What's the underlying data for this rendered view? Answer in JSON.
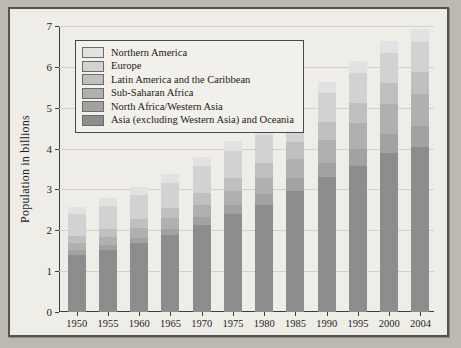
{
  "chart_data": {
    "type": "bar",
    "subtype": "stacked-bar",
    "title": "",
    "xlabel": "",
    "ylabel": "Population in billions",
    "ylim": [
      0,
      7
    ],
    "yticks": [
      0,
      1,
      2,
      3,
      4,
      5,
      6,
      7
    ],
    "grid": true,
    "legend_position": "top-left-inside",
    "categories": [
      "1950",
      "1955",
      "1960",
      "1965",
      "1970",
      "1975",
      "1980",
      "1985",
      "1990",
      "1995",
      "2000",
      "2004"
    ],
    "series": [
      {
        "name": "Asia (excluding Western Asia) and Oceania",
        "color": "#8d8d8d",
        "values": [
          1.4,
          1.52,
          1.68,
          1.88,
          2.13,
          2.39,
          2.63,
          2.97,
          3.3,
          3.58,
          3.88,
          4.05
        ]
      },
      {
        "name": "North Africa/Western Asia",
        "color": "#a2a2a2",
        "values": [
          0.11,
          0.12,
          0.14,
          0.16,
          0.19,
          0.22,
          0.26,
          0.3,
          0.35,
          0.41,
          0.47,
          0.5
        ]
      },
      {
        "name": "Sub-Saharan Africa",
        "color": "#b0b0b0",
        "values": [
          0.18,
          0.2,
          0.23,
          0.26,
          0.3,
          0.34,
          0.4,
          0.47,
          0.55,
          0.64,
          0.73,
          0.78
        ]
      },
      {
        "name": "Latin America and the Caribbean",
        "color": "#c0c0c0",
        "values": [
          0.17,
          0.19,
          0.22,
          0.25,
          0.29,
          0.32,
          0.36,
          0.41,
          0.44,
          0.48,
          0.52,
          0.55
        ]
      },
      {
        "name": "Europe",
        "color": "#d2d2d2",
        "values": [
          0.55,
          0.57,
          0.6,
          0.62,
          0.66,
          0.68,
          0.69,
          0.7,
          0.72,
          0.73,
          0.73,
          0.73
        ]
      },
      {
        "name": "Northern America",
        "color": "#e2e2e2",
        "values": [
          0.17,
          0.18,
          0.2,
          0.21,
          0.23,
          0.24,
          0.25,
          0.26,
          0.28,
          0.3,
          0.31,
          0.33
        ]
      }
    ],
    "totals": [
      2.52,
      2.78,
      3.07,
      3.38,
      3.7,
      4.07,
      4.44,
      4.84,
      5.27,
      5.69,
      6.07,
      6.34
    ]
  },
  "legend": {
    "items": [
      {
        "label": "Northern America"
      },
      {
        "label": "Europe"
      },
      {
        "label": "Latin America and the Caribbean"
      },
      {
        "label": "Sub-Saharan Africa"
      },
      {
        "label": "North Africa/Western Asia"
      },
      {
        "label": "Asia (excluding Western Asia) and Oceania"
      }
    ]
  },
  "colors": {
    "page_background": "#bcb9b1",
    "panel_background": "#efede7",
    "frame_border": "#55534e",
    "gridline": "#d2d0c9",
    "axis": "#3d3c39",
    "text": "#1d1c19"
  }
}
